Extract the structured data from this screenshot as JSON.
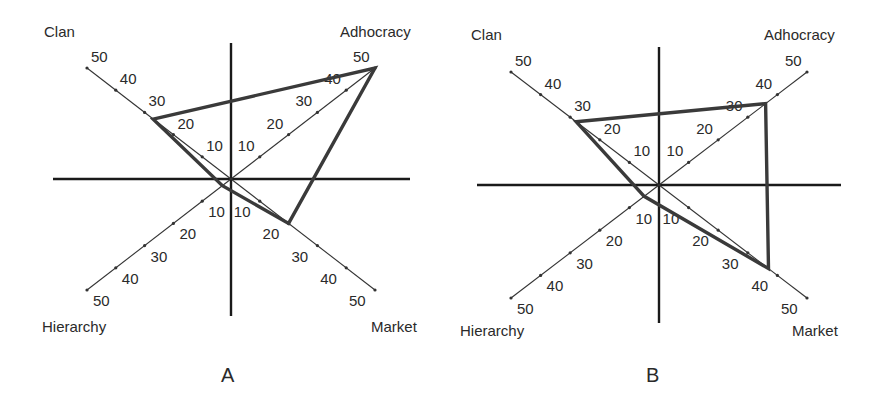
{
  "chart_data": [
    {
      "type": "radar",
      "panel_label": "A",
      "axes": [
        "Clan",
        "Adhocracy",
        "Market",
        "Hierarchy"
      ],
      "axis_directions": {
        "Clan": "upper-left",
        "Adhocracy": "upper-right",
        "Market": "lower-right",
        "Hierarchy": "lower-left"
      },
      "tick_labels": [
        10,
        20,
        30,
        40,
        50
      ],
      "range": [
        0,
        50
      ],
      "values": {
        "Clan": 27,
        "Adhocracy": 50,
        "Market": 20,
        "Hierarchy": 3
      }
    },
    {
      "type": "radar",
      "panel_label": "B",
      "axes": [
        "Clan",
        "Adhocracy",
        "Market",
        "Hierarchy"
      ],
      "axis_directions": {
        "Clan": "upper-left",
        "Adhocracy": "upper-right",
        "Market": "lower-right",
        "Hierarchy": "lower-left"
      },
      "tick_labels": [
        10,
        20,
        30,
        40,
        50
      ],
      "range": [
        0,
        50
      ],
      "values": {
        "Clan": 28,
        "Adhocracy": 36,
        "Market": 37,
        "Hierarchy": 5
      }
    }
  ],
  "panels": [
    {
      "label": "A",
      "quadrants": {
        "clan": "Clan",
        "adhocracy": "Adhocracy",
        "market": "Market",
        "hierarchy": "Hierarchy"
      },
      "ticks": [
        "10",
        "20",
        "30",
        "40",
        "50"
      ]
    },
    {
      "label": "B",
      "quadrants": {
        "clan": "Clan",
        "adhocracy": "Adhocracy",
        "market": "Market",
        "hierarchy": "Hierarchy"
      },
      "ticks": [
        "10",
        "20",
        "30",
        "40",
        "50"
      ]
    }
  ]
}
